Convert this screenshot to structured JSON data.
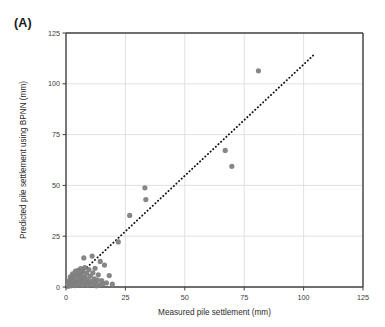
{
  "panel": {
    "label": "(A)"
  },
  "chart_data": {
    "type": "scatter",
    "title": "",
    "subtitle": "",
    "xlabel": "Measured pile settlement (mm)",
    "ylabel": "Predicted pile settlement using BPNN (mm)",
    "xlim": [
      0,
      125
    ],
    "ylim": [
      0,
      125
    ],
    "xticks": [
      0,
      25,
      50,
      75,
      100,
      125
    ],
    "yticks": [
      0,
      25,
      50,
      75,
      100,
      125
    ],
    "grid": true,
    "legend": "none",
    "marker_color": "#808080",
    "marker_size_px": 5.2,
    "axis_color": "#3f3f3f",
    "grid_color": "#d9d9d9",
    "series": [
      {
        "name": "Pile settlement data",
        "marker": "circle",
        "color": "#808080",
        "points": [
          [
            0.6,
            0.4
          ],
          [
            0.8,
            1.2
          ],
          [
            1.0,
            0.5
          ],
          [
            1.2,
            2.2
          ],
          [
            1.3,
            0.8
          ],
          [
            1.5,
            3.4
          ],
          [
            1.6,
            1.0
          ],
          [
            1.8,
            5.0
          ],
          [
            2.0,
            0.6
          ],
          [
            2.1,
            2.8
          ],
          [
            2.3,
            1.5
          ],
          [
            2.5,
            4.2
          ],
          [
            2.6,
            0.9
          ],
          [
            2.8,
            6.5
          ],
          [
            3.0,
            2.0
          ],
          [
            3.1,
            3.6
          ],
          [
            3.3,
            1.1
          ],
          [
            3.5,
            5.5
          ],
          [
            3.7,
            0.7
          ],
          [
            3.9,
            2.4
          ],
          [
            4.0,
            7.8
          ],
          [
            4.2,
            1.6
          ],
          [
            4.4,
            3.0
          ],
          [
            4.6,
            5.8
          ],
          [
            4.8,
            0.9
          ],
          [
            5.0,
            2.6
          ],
          [
            5.2,
            8.2
          ],
          [
            5.4,
            4.5
          ],
          [
            5.6,
            1.3
          ],
          [
            5.8,
            6.2
          ],
          [
            6.0,
            3.2
          ],
          [
            6.2,
            9.0
          ],
          [
            6.5,
            2.0
          ],
          [
            6.7,
            5.1
          ],
          [
            6.9,
            0.8
          ],
          [
            7.1,
            7.2
          ],
          [
            7.3,
            3.8
          ],
          [
            7.5,
            14.3
          ],
          [
            7.7,
            1.8
          ],
          [
            7.9,
            9.6
          ],
          [
            8.1,
            4.8
          ],
          [
            8.4,
            2.3
          ],
          [
            8.7,
            6.8
          ],
          [
            9.0,
            0.9
          ],
          [
            9.3,
            3.4
          ],
          [
            9.6,
            8.6
          ],
          [
            9.9,
            1.7
          ],
          [
            10.2,
            5.4
          ],
          [
            10.6,
            2.6
          ],
          [
            11.0,
            15.2
          ],
          [
            11.3,
            7.0
          ],
          [
            11.6,
            1.2
          ],
          [
            11.9,
            4.0
          ],
          [
            12.2,
            9.2
          ],
          [
            12.5,
            2.4
          ],
          [
            12.8,
            0.6
          ],
          [
            13.2,
            3.4
          ],
          [
            13.6,
            6.0
          ],
          [
            14.0,
            1.0
          ],
          [
            14.4,
            12.6
          ],
          [
            15.0,
            3.2
          ],
          [
            15.5,
            1.6
          ],
          [
            16.2,
            10.8
          ],
          [
            17.0,
            2.0
          ],
          [
            18.2,
            5.6
          ],
          [
            19.5,
            1.4
          ],
          [
            22.0,
            22.2
          ],
          [
            26.8,
            35.2
          ],
          [
            33.2,
            48.8
          ],
          [
            33.6,
            43.0
          ],
          [
            67.0,
            67.2
          ],
          [
            69.8,
            59.4
          ],
          [
            81.0,
            106.4
          ]
        ]
      }
    ],
    "trendline": {
      "name": "1:1 reference trendline",
      "style": "dotted",
      "color": "#111111",
      "x_start": 0.0,
      "y_start": 0.0,
      "x_end": 105.0,
      "y_end": 115.0
    }
  }
}
